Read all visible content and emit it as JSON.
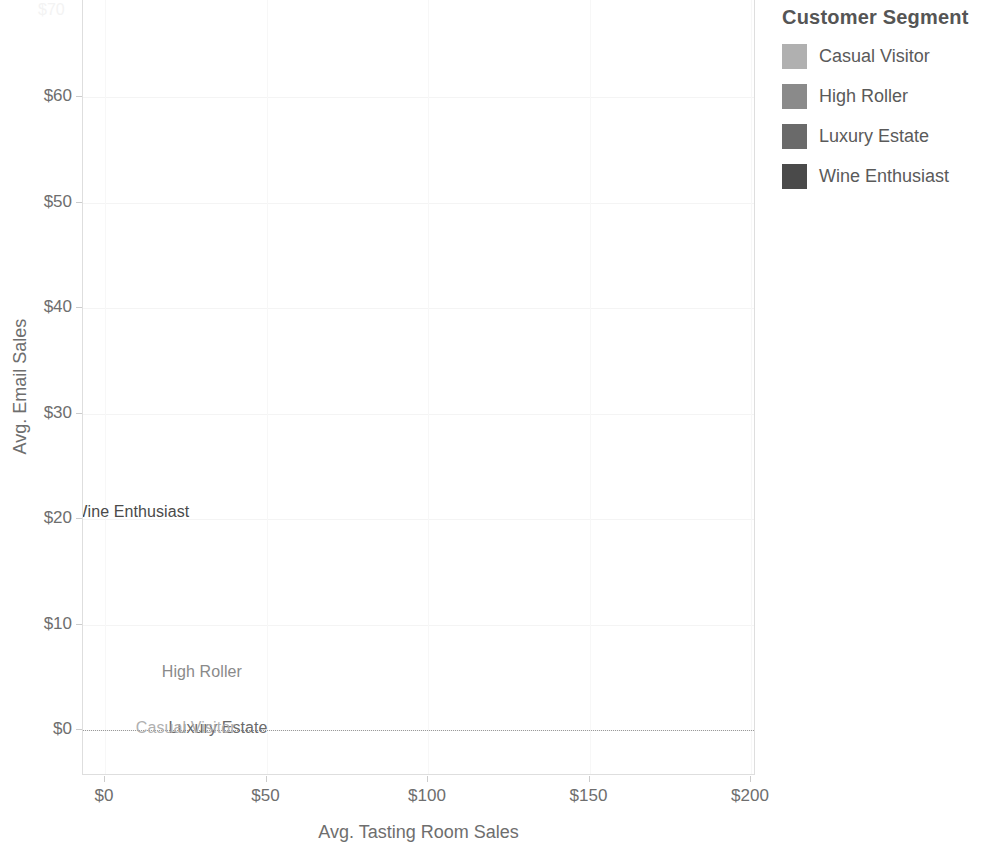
{
  "chart_data": {
    "type": "scatter",
    "title": "",
    "xlabel": "Avg. Tasting Room Sales",
    "ylabel": "Avg. Email Sales",
    "xlim": [
      -8,
      230
    ],
    "ylim": [
      -5,
      68
    ],
    "xticks": [
      "$0",
      "$50",
      "$100",
      "$150",
      "$200"
    ],
    "xtick_values": [
      0,
      50,
      100,
      150,
      200
    ],
    "yticks": [
      "$0",
      "$10",
      "$20",
      "$30",
      "$40",
      "$50",
      "$60"
    ],
    "ytick_values": [
      0,
      10,
      20,
      30,
      40,
      50,
      60
    ],
    "grid": true,
    "legend_position": "right",
    "legend_title": "Customer Segment",
    "zero_reference_line": 0,
    "points": [
      {
        "label": "Wine Enthusiast",
        "x": 8,
        "y": 20.7,
        "color": "#4a4a4a"
      },
      {
        "label": "High Roller",
        "x": 30,
        "y": 5.5,
        "color": "#8a8a8a"
      },
      {
        "label": "Luxury Estate",
        "x": 35,
        "y": 0.2,
        "color": "#6a6a6a"
      },
      {
        "label": "Casual Visitor",
        "x": 25,
        "y": 0.2,
        "color": "#b0b0b0"
      }
    ]
  },
  "legend": {
    "title": "Customer Segment",
    "items": [
      {
        "label": "Casual Visitor",
        "color": "#b0b0b0"
      },
      {
        "label": "High Roller",
        "color": "#8a8a8a"
      },
      {
        "label": "Luxury Estate",
        "color": "#6a6a6a"
      },
      {
        "label": "Wine Enthusiast",
        "color": "#4a4a4a"
      }
    ]
  },
  "axes": {
    "x_title": "Avg. Tasting Room Sales",
    "y_title": "Avg. Email Sales",
    "x_tick_labels": [
      "$0",
      "$50",
      "$100",
      "$150",
      "$200"
    ],
    "y_tick_labels": [
      "$0",
      "$10",
      "$20",
      "$30",
      "$40",
      "$50",
      "$60"
    ]
  },
  "artifact": {
    "clipped_top_label": "$70"
  }
}
